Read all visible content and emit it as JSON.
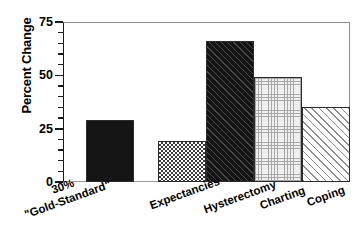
{
  "chart_data": {
    "type": "bar",
    "title": "",
    "xlabel": "",
    "ylabel": "Percent Change",
    "ylim": [
      0,
      75
    ],
    "ytick_labels": [
      "0",
      "25",
      "50",
      "75"
    ],
    "ytick_values": [
      0,
      25,
      50,
      75
    ],
    "minor_tick_interval": 5,
    "grid": false,
    "legend": "none",
    "categories": [
      "30%\n\"Gold-Standard\"",
      "Expectancies",
      "Hysterectomy",
      "Charting",
      "Coping"
    ],
    "values": [
      29,
      19,
      66,
      49,
      35
    ],
    "bars": [
      {
        "label_line1": "30%",
        "label_line2": "\"Gold-Standard\"",
        "value": 29,
        "fill": "solid-black",
        "group": "reference"
      },
      {
        "label_line1": "Expectancies",
        "label_line2": "",
        "value": 19,
        "fill": "checker",
        "group": "study"
      },
      {
        "label_line1": "Hysterectomy",
        "label_line2": "",
        "value": 66,
        "fill": "dark-diagonal",
        "group": "study"
      },
      {
        "label_line1": "Charting",
        "label_line2": "",
        "value": 49,
        "fill": "light-grid",
        "group": "study"
      },
      {
        "label_line1": "Coping",
        "label_line2": "",
        "value": 35,
        "fill": "light-diagonal",
        "group": "study"
      }
    ],
    "colors": {
      "axis": "#1a1a1a",
      "frame": "#8d8d8d",
      "background": "#ffffff",
      "bar_outline": "#2b2b2b"
    }
  }
}
